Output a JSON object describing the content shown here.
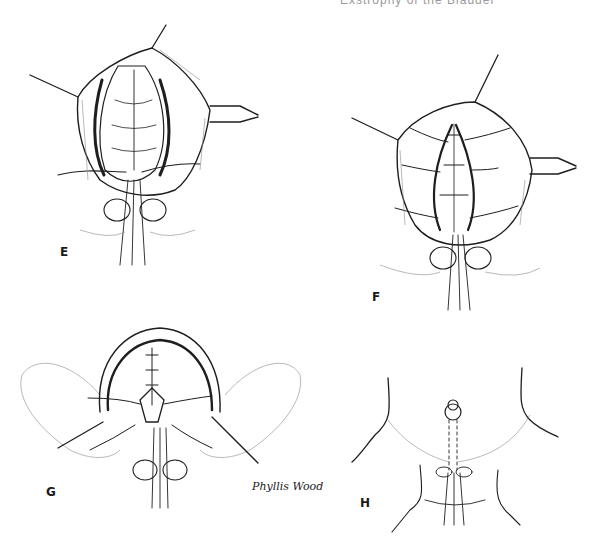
{
  "figure": {
    "header_text_cut": "Exstrophy of the Bladder",
    "panels": [
      {
        "id": "E",
        "label": "E",
        "description": "Open bladder plate with midline closure, retractors and traction sutures"
      },
      {
        "id": "F",
        "label": "F",
        "description": "Bladder closure continued with layered sutures and urethral stent"
      },
      {
        "id": "G",
        "label": "G",
        "description": "Pelvic closure with bladder tubularized, legs abducted"
      },
      {
        "id": "H",
        "label": "H",
        "description": "Completed abdominal wall closure with suprapubic tube"
      }
    ],
    "signature": "Phyllis Wood",
    "colors": {
      "background": "#ffffff",
      "ink": "#1e1e1e",
      "hatch": "#8a8a8a"
    }
  }
}
